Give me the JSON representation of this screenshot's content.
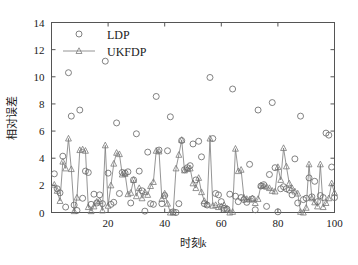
{
  "chart_data": {
    "type": "scatter",
    "title": "",
    "xlabel": "时刻k",
    "xlabel_plain": "时刻",
    "xlabel_italic": "k",
    "ylabel": "相对误差",
    "xlim": [
      0,
      100
    ],
    "ylim": [
      0,
      14
    ],
    "xticks": [
      20,
      40,
      60,
      80,
      100
    ],
    "yticks": [
      0,
      2,
      4,
      6,
      8,
      10,
      12,
      14
    ],
    "grid": false,
    "legend_position": "top-left",
    "colors": {
      "ldp": "#6b6b6b",
      "ukfdp": "#7a7a7a",
      "axis": "#555555",
      "text": "#1a1a1a",
      "background": "#ffffff"
    },
    "series": [
      {
        "name": "LDP",
        "marker": "circle",
        "line": false,
        "x": [
          1,
          2,
          3,
          4,
          5,
          6,
          7,
          8,
          9,
          10,
          11,
          12,
          13,
          14,
          15,
          16,
          17,
          18,
          19,
          20,
          21,
          22,
          23,
          24,
          25,
          26,
          27,
          28,
          29,
          30,
          31,
          32,
          33,
          34,
          35,
          36,
          37,
          38,
          39,
          40,
          41,
          42,
          43,
          44,
          45,
          46,
          47,
          48,
          49,
          50,
          51,
          52,
          53,
          54,
          55,
          56,
          57,
          58,
          59,
          60,
          61,
          62,
          63,
          64,
          65,
          66,
          67,
          68,
          69,
          70,
          71,
          72,
          73,
          74,
          75,
          76,
          77,
          78,
          79,
          80,
          81,
          82,
          83,
          84,
          85,
          86,
          87,
          88,
          89,
          90,
          91,
          92,
          93,
          94,
          95,
          96,
          97,
          98,
          99,
          100
        ],
        "values": [
          2.85,
          1.75,
          1.45,
          4.15,
          0.4,
          10.3,
          7.1,
          0.55,
          0.15,
          7.55,
          1.05,
          3.05,
          2.95,
          0.6,
          1.35,
          0.7,
          1.3,
          0.65,
          11.15,
          2.9,
          0.6,
          0.75,
          6.6,
          1.4,
          2.95,
          2.9,
          3.0,
          0.7,
          2.4,
          5.8,
          3.05,
          1.6,
          0.1,
          4.45,
          0.65,
          0.6,
          8.55,
          4.6,
          0.65,
          1.25,
          4.55,
          7.05,
          0.05,
          0.0,
          0.65,
          5.3,
          3.15,
          3.3,
          3.45,
          5.05,
          2.4,
          5.25,
          4.1,
          0.65,
          0.55,
          9.95,
          5.45,
          1.4,
          1.3,
          0.8,
          0.3,
          0.25,
          1.35,
          9.1,
          1.2,
          0.8,
          1.1,
          0.95,
          0.75,
          3.55,
          1.0,
          0.2,
          7.55,
          1.95,
          2.05,
          0.45,
          2.8,
          8.1,
          3.3,
          0.05,
          1.75,
          1.9,
          1.75,
          1.65,
          1.3,
          3.95,
          0.7,
          7.1,
          0.95,
          1.05,
          2.55,
          1.15,
          2.3,
          0.8,
          1.25,
          1.1,
          5.85,
          5.7,
          3.35,
          1.1
        ]
      },
      {
        "name": "UKFDP",
        "marker": "triangle",
        "line": true,
        "x": [
          1,
          2,
          3,
          4,
          5,
          6,
          7,
          8,
          9,
          10,
          11,
          12,
          13,
          14,
          15,
          16,
          17,
          18,
          19,
          20,
          21,
          22,
          23,
          24,
          25,
          26,
          27,
          28,
          29,
          30,
          31,
          32,
          33,
          34,
          35,
          36,
          37,
          38,
          39,
          40,
          41,
          42,
          43,
          44,
          45,
          46,
          47,
          48,
          49,
          50,
          51,
          52,
          53,
          54,
          55,
          56,
          57,
          58,
          59,
          60,
          61,
          62,
          63,
          64,
          65,
          66,
          67,
          68,
          69,
          70,
          71,
          72,
          73,
          74,
          75,
          76,
          77,
          78,
          79,
          80,
          81,
          82,
          83,
          84,
          85,
          86,
          87,
          88,
          89,
          90,
          91,
          92,
          93,
          94,
          95,
          96,
          97,
          98,
          99,
          100
        ],
        "values": [
          2.05,
          1.6,
          0.85,
          3.75,
          3.25,
          5.45,
          3.2,
          0.1,
          1.1,
          4.6,
          4.65,
          4.55,
          0.4,
          0.1,
          0.45,
          0.8,
          0.85,
          0.15,
          4.95,
          0.5,
          2.0,
          3.6,
          4.4,
          4.3,
          2.8,
          2.85,
          1.35,
          1.45,
          2.4,
          1.2,
          1.8,
          1.05,
          1.5,
          1.3,
          1.95,
          2.25,
          4.55,
          4.5,
          1.0,
          1.4,
          0.65,
          0.0,
          0.0,
          3.25,
          4.25,
          5.35,
          3.1,
          3.2,
          3.25,
          2.15,
          1.8,
          2.55,
          1.5,
          0.85,
          0.6,
          5.45,
          0.5,
          0.55,
          0.4,
          0.45,
          0.55,
          0.3,
          0.0,
          0.05,
          4.7,
          3.05,
          3.15,
          1.1,
          1.0,
          0.95,
          1.05,
          0.7,
          1.0,
          2.0,
          1.95,
          1.9,
          1.8,
          1.6,
          1.55,
          3.35,
          2.4,
          4.75,
          3.4,
          2.15,
          1.8,
          1.55,
          1.4,
          0.05,
          0.0,
          0.35,
          3.55,
          1.05,
          0.75,
          0.45,
          3.55,
          0.4,
          0.7,
          1.05,
          2.15,
          1.45
        ]
      }
    ]
  },
  "legend": {
    "items": [
      {
        "label": "LDP",
        "marker": "circle",
        "has_line": false
      },
      {
        "label": "UKFDP",
        "marker": "triangle",
        "has_line": true
      }
    ]
  }
}
